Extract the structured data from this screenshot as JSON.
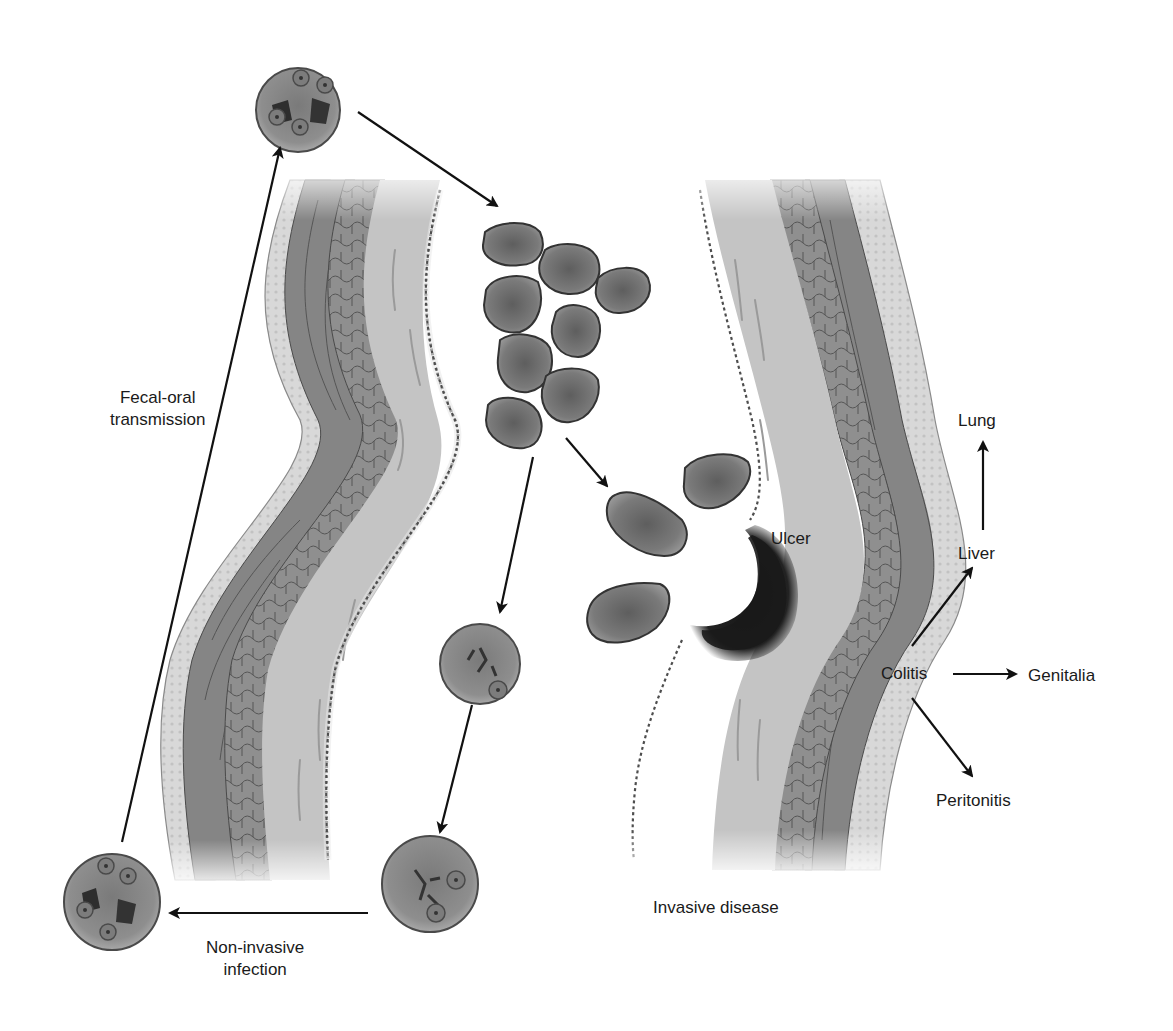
{
  "diagram": {
    "title_hidden": "",
    "colors": {
      "background": "#ffffff",
      "serosa": "#dcdcdc",
      "muscle_outer": "#8a8a8a",
      "muscle_inner": "#7c7c7c",
      "submucosa": "#b9b9b9",
      "mucosa": "#c8c8c8",
      "villi_stroke": "#5a5a5a",
      "trophozoite_fill": "#787878",
      "trophozoite_stroke": "#333333",
      "cyst_fill": "#8a8a8a",
      "cyst_stroke": "#4a4a4a",
      "ulcer": "#1c1c1c",
      "arrow": "#111111",
      "text": "#1a1a1a"
    },
    "labels": {
      "fecal_oral": [
        "Fecal-oral",
        "transmission"
      ],
      "non_invasive": [
        "Non-invasive",
        "infection"
      ],
      "invasive": "Invasive disease",
      "ulcer": "Ulcer",
      "colitis": "Colitis",
      "liver": "Liver",
      "lung": "Lung",
      "genitalia": "Genitalia",
      "peritonitis": "Peritonitis"
    },
    "stages": [
      {
        "id": "ingested-cyst",
        "type": "mature-cyst",
        "nuclei": 4
      },
      {
        "id": "trophozoites-lumen",
        "type": "trophozoite-cluster",
        "count": 9
      },
      {
        "id": "invading-trophozoites",
        "type": "trophozoite",
        "count": 3
      },
      {
        "id": "precyst",
        "type": "immature-cyst",
        "nuclei": 1
      },
      {
        "id": "cyst-two-nuclei",
        "type": "immature-cyst",
        "nuclei": 2
      },
      {
        "id": "excreted-cyst",
        "type": "mature-cyst",
        "nuclei": 4
      }
    ],
    "spread_sites": [
      "Liver",
      "Lung",
      "Genitalia",
      "Peritonitis"
    ]
  }
}
